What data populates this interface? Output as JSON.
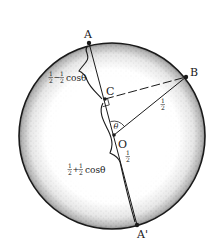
{
  "diagram": {
    "type": "geometry",
    "circle": {
      "cx": 112,
      "cy": 136,
      "r": 93,
      "stroke": "#1a1a1a",
      "shading": "stippled rim"
    },
    "points": {
      "A": {
        "label": "A",
        "x": 89,
        "y": 43
      },
      "B": {
        "label": "B",
        "x": 186,
        "y": 77
      },
      "C": {
        "label": "C",
        "x": 105,
        "y": 99
      },
      "O": {
        "label": "O",
        "x": 114,
        "y": 135
      },
      "A_prime": {
        "label": "A'",
        "x": 137,
        "y": 225
      }
    },
    "angle": {
      "label": "θ",
      "at": "O",
      "between": [
        "OA",
        "OB"
      ]
    },
    "segments": {
      "AC": {
        "label_num1": "1",
        "label_den1": "2",
        "label_op": "−",
        "label_num2": "1",
        "label_den2": "2",
        "label_func": "cosθ"
      },
      "CA_prime": {
        "label_num1": "1",
        "label_den1": "2",
        "label_op": "+",
        "label_num2": "1",
        "label_den2": "2",
        "label_func": "cosθ"
      },
      "OB": {
        "label_num": "1",
        "label_den": "2"
      },
      "OA_prime": {
        "label_num": "1",
        "label_den": "2"
      }
    },
    "colors": {
      "ink": "#1a1a1a",
      "background": "#ffffff"
    }
  }
}
